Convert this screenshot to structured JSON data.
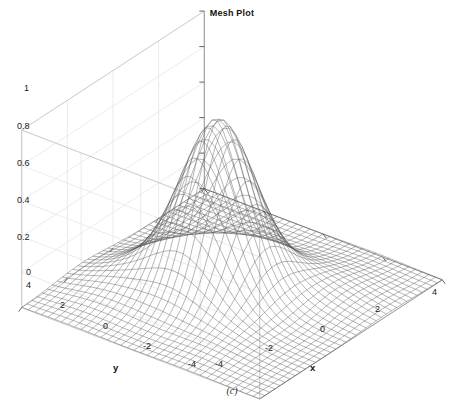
{
  "figure": {
    "title": "Mesh Plot",
    "caption": "(c)",
    "background_color": "#ffffff",
    "mesh_color": "#555555",
    "grid_color": "#e2e2e2",
    "box_color": "#c9c9c9",
    "text_color": "#1a1a1a"
  },
  "axes": {
    "x": {
      "label": "x",
      "ticks": [
        "-4",
        "-2",
        "0",
        "2",
        "4"
      ],
      "tick_values": [
        -4,
        -2,
        0,
        2,
        4
      ],
      "range": [
        -4,
        4
      ]
    },
    "y": {
      "label": "y",
      "ticks": [
        "4",
        "2",
        "0",
        "-2",
        "-4"
      ],
      "tick_values": [
        4,
        2,
        0,
        -2,
        -4
      ],
      "range": [
        -4,
        4
      ]
    },
    "z": {
      "label": "",
      "ticks": [
        "0",
        "0.2",
        "0.4",
        "0.6",
        "0.8",
        "1"
      ],
      "tick_values": [
        0,
        0.2,
        0.4,
        0.6,
        0.8,
        1
      ],
      "range": [
        0,
        1
      ]
    }
  },
  "chart_data": {
    "type": "surface",
    "render": "wireframe-mesh",
    "title": "Mesh Plot",
    "caption": "(c)",
    "xlabel": "x",
    "ylabel": "y",
    "zlabel": "",
    "xlim": [
      -4,
      4
    ],
    "ylim": [
      -4,
      4
    ],
    "zlim": [
      0,
      1
    ],
    "xticks": [
      -4,
      -2,
      0,
      2,
      4
    ],
    "yticks": [
      -4,
      -2,
      0,
      2,
      4
    ],
    "zticks": [
      0,
      0.2,
      0.4,
      0.6,
      0.8,
      1
    ],
    "grid": true,
    "legend": null,
    "peak_value": 0.94,
    "peak_location": [
      -0.45,
      0.0
    ],
    "surface_description": "Single smooth Gaussian-like peak rising from a flat near-zero plane, MATLAB peaks-style dominant lobe",
    "mesh_divisions": 36,
    "view_azimuth": -37.5,
    "view_elevation": 30,
    "function": "0.94 * exp(-((x + 0.45)^2 + y^2) / 2.1) + small side lobes",
    "samples": {
      "x": [
        -4,
        -3,
        -2,
        -1,
        0,
        1,
        2,
        3,
        4
      ],
      "y": [
        -4,
        -3,
        -2,
        -1,
        0,
        1,
        2,
        3,
        4
      ],
      "z": [
        [
          0.0,
          0.0,
          0.0,
          0.0,
          0.0,
          0.0,
          0.0,
          0.0,
          0.0
        ],
        [
          0.0,
          0.0,
          0.01,
          0.02,
          0.02,
          0.01,
          0.0,
          0.0,
          0.0
        ],
        [
          0.0,
          0.01,
          0.04,
          0.1,
          0.11,
          0.06,
          0.02,
          0.0,
          0.0
        ],
        [
          0.0,
          0.02,
          0.12,
          0.38,
          0.42,
          0.21,
          0.05,
          0.01,
          0.0
        ],
        [
          0.0,
          0.03,
          0.18,
          0.7,
          0.94,
          0.42,
          0.09,
          0.01,
          0.0
        ],
        [
          0.0,
          0.02,
          0.12,
          0.38,
          0.42,
          0.21,
          0.05,
          0.01,
          0.0
        ],
        [
          0.0,
          0.01,
          0.04,
          0.1,
          0.11,
          0.06,
          0.02,
          0.0,
          0.0
        ],
        [
          0.0,
          0.0,
          0.01,
          0.02,
          0.02,
          0.01,
          0.0,
          0.0,
          0.0
        ],
        [
          0.0,
          0.0,
          0.0,
          0.0,
          0.0,
          0.0,
          0.0,
          0.0,
          0.0
        ]
      ]
    }
  },
  "tick_positions": {
    "z": [
      {
        "label": "1",
        "left": 24,
        "top": 84
      },
      {
        "label": "0.8",
        "left": 17,
        "top": 122
      },
      {
        "label": "0.6",
        "left": 17,
        "top": 159
      },
      {
        "label": "0.4",
        "left": 17,
        "top": 196
      },
      {
        "label": "0.2",
        "left": 17,
        "top": 233
      },
      {
        "label": "0",
        "left": 26,
        "top": 268
      }
    ],
    "y": [
      {
        "label": "4",
        "left": 26,
        "top": 281
      },
      {
        "label": "2",
        "left": 60,
        "top": 301
      },
      {
        "label": "0",
        "left": 103,
        "top": 322
      },
      {
        "label": "-2",
        "left": 143,
        "top": 342
      },
      {
        "label": "-4",
        "left": 188,
        "top": 360
      }
    ],
    "x": [
      {
        "label": "-4",
        "left": 215,
        "top": 360
      },
      {
        "label": "-2",
        "left": 265,
        "top": 344
      },
      {
        "label": "0",
        "left": 320,
        "top": 325
      },
      {
        "label": "2",
        "left": 375,
        "top": 305
      },
      {
        "label": "4",
        "left": 432,
        "top": 288
      }
    ]
  },
  "axis_title_positions": {
    "x": {
      "left": 310,
      "top": 363
    },
    "y": {
      "left": 113,
      "top": 363
    }
  }
}
